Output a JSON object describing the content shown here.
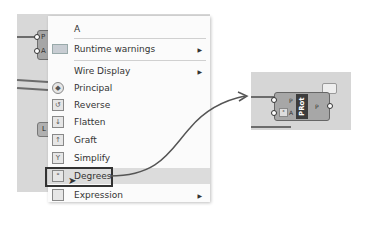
{
  "context_menu": {
    "title": "A",
    "items": [
      {
        "label": "Runtime warnings",
        "icon": "warning-icon",
        "has_submenu": true
      },
      {
        "label": "Wire Display",
        "icon": "",
        "has_submenu": true
      },
      {
        "label": "Principal",
        "icon": "principal-icon",
        "has_submenu": false
      },
      {
        "label": "Reverse",
        "icon": "reverse-icon",
        "has_submenu": false
      },
      {
        "label": "Flatten",
        "icon": "flatten-icon",
        "has_submenu": false
      },
      {
        "label": "Graft",
        "icon": "graft-icon",
        "has_submenu": false
      },
      {
        "label": "Simplify",
        "icon": "simplify-icon",
        "has_submenu": false
      },
      {
        "label": "Degrees",
        "icon": "degrees-icon",
        "has_submenu": false,
        "highlighted": true
      },
      {
        "label": "Expression",
        "icon": "expression-icon",
        "has_submenu": true
      }
    ]
  },
  "left_component": {
    "inputs": [
      "P",
      "A"
    ],
    "secondary_label": "L"
  },
  "right_component": {
    "name": "PRot",
    "inputs": [
      "P",
      "A"
    ],
    "outputs": [
      "P"
    ]
  }
}
